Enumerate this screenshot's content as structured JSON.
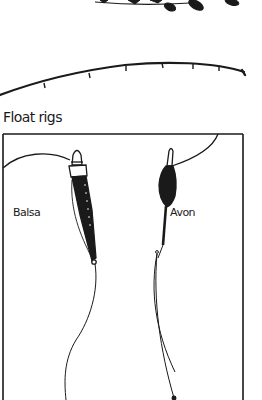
{
  "illustration": {
    "heading": "Float rigs",
    "labels": {
      "balsa": "Balsa",
      "avon": "Avon"
    },
    "colors": {
      "ink": "#1a1a1a",
      "paper": "#ffffff"
    },
    "elements": [
      "fish-fragment-top",
      "fishing-rod-with-guides",
      "rig-frame",
      "balsa-float",
      "avon-float",
      "fishing-lines"
    ]
  }
}
